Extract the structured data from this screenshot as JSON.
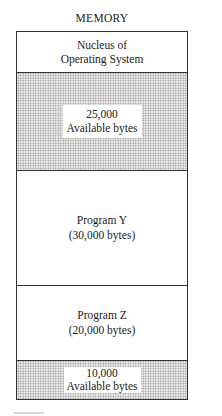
{
  "diagram": {
    "title": "MEMORY",
    "sections": [
      {
        "line1": "Nucleus of",
        "line2": "Operating System",
        "type": "os",
        "shaded": false
      },
      {
        "line1": "25,000",
        "line2": "Available bytes",
        "type": "free",
        "shaded": true
      },
      {
        "line1": "Program Y",
        "line2": "(30,000 bytes)",
        "type": "program",
        "shaded": false
      },
      {
        "line1": "Program Z",
        "line2": "(20,000 bytes)",
        "type": "program",
        "shaded": false
      },
      {
        "line1": "10,000",
        "line2": "Available bytes",
        "type": "free",
        "shaded": true
      }
    ],
    "colors": {
      "border": "#333333",
      "shade_dots": "#8a8a8a",
      "shade_bg": "#e9e9e9"
    }
  }
}
